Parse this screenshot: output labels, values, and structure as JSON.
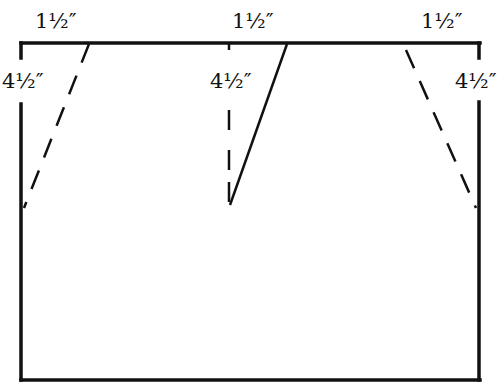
{
  "diagram": {
    "type": "pattern-dart-layout",
    "labels": {
      "top_left": "1½″",
      "top_center": "1½″",
      "top_right": "1½″",
      "side_left": "4½″",
      "center_depth": "4½″",
      "side_right": "4½″"
    },
    "colors": {
      "line": "#111111",
      "background": "#ffffff"
    }
  }
}
